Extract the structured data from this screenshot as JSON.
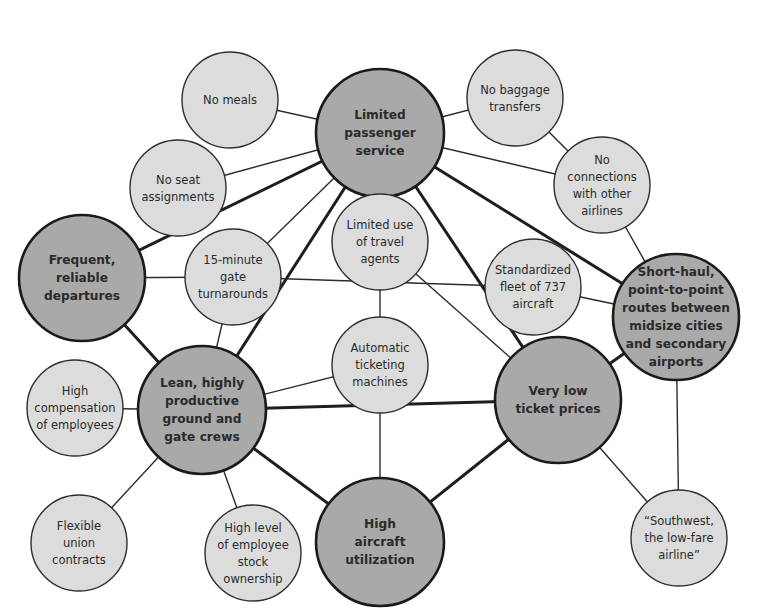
{
  "diagram": {
    "colors": {
      "background": "#ffffff",
      "primary_node_fill": "#a9a9a9",
      "secondary_node_fill": "#dcdcdc",
      "stroke": "#2b2b2b"
    },
    "nodes": [
      {
        "id": "limited-passenger-service",
        "type": "primary",
        "x": 380,
        "y": 133,
        "r": 64,
        "lines": [
          "Limited",
          "passenger",
          "service"
        ]
      },
      {
        "id": "no-meals",
        "type": "secondary",
        "x": 230,
        "y": 100,
        "r": 48,
        "lines": [
          "No meals"
        ]
      },
      {
        "id": "no-seat-assignments",
        "type": "secondary",
        "x": 178,
        "y": 188,
        "r": 48,
        "lines": [
          "No seat",
          "assignments"
        ]
      },
      {
        "id": "no-baggage-transfers",
        "type": "secondary",
        "x": 515,
        "y": 98,
        "r": 48,
        "lines": [
          "No baggage",
          "transfers"
        ]
      },
      {
        "id": "no-connections",
        "type": "secondary",
        "x": 602,
        "y": 185,
        "r": 48,
        "lines": [
          "No",
          "connections",
          "with other",
          "airlines"
        ]
      },
      {
        "id": "frequent-reliable-departures",
        "type": "primary",
        "x": 82,
        "y": 278,
        "r": 63,
        "lines": [
          "Frequent,",
          "reliable",
          "departures"
        ]
      },
      {
        "id": "gate-turnarounds",
        "type": "secondary",
        "x": 233,
        "y": 277,
        "r": 48,
        "lines": [
          "15-minute",
          "gate",
          "turnarounds"
        ]
      },
      {
        "id": "limited-travel-agents",
        "type": "secondary",
        "x": 380,
        "y": 242,
        "r": 48,
        "lines": [
          "Limited use",
          "of travel",
          "agents"
        ]
      },
      {
        "id": "standardized-fleet",
        "type": "secondary",
        "x": 533,
        "y": 287,
        "r": 48,
        "lines": [
          "Standardized",
          "fleet of 737",
          "aircraft"
        ]
      },
      {
        "id": "short-haul-routes",
        "type": "primary",
        "x": 676,
        "y": 317,
        "r": 63,
        "lines": [
          "Short-haul,",
          "point-to-point",
          "routes between",
          "midsize cities",
          "and secondary",
          "airports"
        ]
      },
      {
        "id": "automatic-ticketing",
        "type": "secondary",
        "x": 380,
        "y": 365,
        "r": 48,
        "lines": [
          "Automatic",
          "ticketing",
          "machines"
        ]
      },
      {
        "id": "lean-crews",
        "type": "primary",
        "x": 202,
        "y": 410,
        "r": 64,
        "lines": [
          "Lean, highly",
          "productive",
          "ground and",
          "gate crews"
        ]
      },
      {
        "id": "high-compensation",
        "type": "secondary",
        "x": 75,
        "y": 408,
        "r": 48,
        "lines": [
          "High",
          "compensation",
          "of employees"
        ]
      },
      {
        "id": "very-low-prices",
        "type": "primary",
        "x": 558,
        "y": 400,
        "r": 63,
        "lines": [
          "Very low",
          "ticket prices"
        ]
      },
      {
        "id": "flexible-union",
        "type": "secondary",
        "x": 79,
        "y": 543,
        "r": 48,
        "lines": [
          "Flexible",
          "union",
          "contracts"
        ]
      },
      {
        "id": "stock-ownership",
        "type": "secondary",
        "x": 253,
        "y": 553,
        "r": 48,
        "lines": [
          "High level",
          "of employee",
          "stock",
          "ownership"
        ]
      },
      {
        "id": "high-utilization",
        "type": "primary",
        "x": 380,
        "y": 542,
        "r": 64,
        "lines": [
          "High",
          "aircraft",
          "utilization"
        ]
      },
      {
        "id": "southwest-slogan",
        "type": "secondary",
        "x": 679,
        "y": 538,
        "r": 48,
        "lines": [
          "“Southwest,",
          "the low-fare",
          "airline”"
        ]
      }
    ],
    "edges": [
      {
        "from": "limited-passenger-service",
        "to": "no-meals",
        "weight": "thin"
      },
      {
        "from": "limited-passenger-service",
        "to": "no-seat-assignments",
        "weight": "thin"
      },
      {
        "from": "limited-passenger-service",
        "to": "no-baggage-transfers",
        "weight": "thin"
      },
      {
        "from": "limited-passenger-service",
        "to": "no-connections",
        "weight": "thin"
      },
      {
        "from": "limited-passenger-service",
        "to": "frequent-reliable-departures",
        "weight": "thick"
      },
      {
        "from": "limited-passenger-service",
        "to": "gate-turnarounds",
        "weight": "thin"
      },
      {
        "from": "limited-passenger-service",
        "to": "limited-travel-agents",
        "weight": "thin"
      },
      {
        "from": "limited-passenger-service",
        "to": "short-haul-routes",
        "weight": "thick"
      },
      {
        "from": "limited-passenger-service",
        "to": "lean-crews",
        "weight": "thick"
      },
      {
        "from": "limited-passenger-service",
        "to": "very-low-prices",
        "weight": "thick"
      },
      {
        "from": "no-baggage-transfers",
        "to": "no-connections",
        "weight": "thin"
      },
      {
        "from": "no-connections",
        "to": "short-haul-routes",
        "weight": "thin"
      },
      {
        "from": "frequent-reliable-departures",
        "to": "gate-turnarounds",
        "weight": "thin"
      },
      {
        "from": "frequent-reliable-departures",
        "to": "lean-crews",
        "weight": "thick"
      },
      {
        "from": "gate-turnarounds",
        "to": "standardized-fleet",
        "weight": "thin"
      },
      {
        "from": "gate-turnarounds",
        "to": "lean-crews",
        "weight": "thin"
      },
      {
        "from": "limited-travel-agents",
        "to": "automatic-ticketing",
        "weight": "thin"
      },
      {
        "from": "limited-travel-agents",
        "to": "very-low-prices",
        "weight": "thin"
      },
      {
        "from": "standardized-fleet",
        "to": "short-haul-routes",
        "weight": "thin"
      },
      {
        "from": "short-haul-routes",
        "to": "very-low-prices",
        "weight": "thick"
      },
      {
        "from": "short-haul-routes",
        "to": "southwest-slogan",
        "weight": "thin"
      },
      {
        "from": "automatic-ticketing",
        "to": "lean-crews",
        "weight": "thin"
      },
      {
        "from": "automatic-ticketing",
        "to": "high-utilization",
        "weight": "thin"
      },
      {
        "from": "lean-crews",
        "to": "very-low-prices",
        "weight": "thick"
      },
      {
        "from": "lean-crews",
        "to": "high-compensation",
        "weight": "thin"
      },
      {
        "from": "lean-crews",
        "to": "flexible-union",
        "weight": "thin"
      },
      {
        "from": "lean-crews",
        "to": "stock-ownership",
        "weight": "thin"
      },
      {
        "from": "lean-crews",
        "to": "high-utilization",
        "weight": "thick"
      },
      {
        "from": "high-utilization",
        "to": "very-low-prices",
        "weight": "thick"
      },
      {
        "from": "very-low-prices",
        "to": "southwest-slogan",
        "weight": "thin"
      }
    ]
  }
}
